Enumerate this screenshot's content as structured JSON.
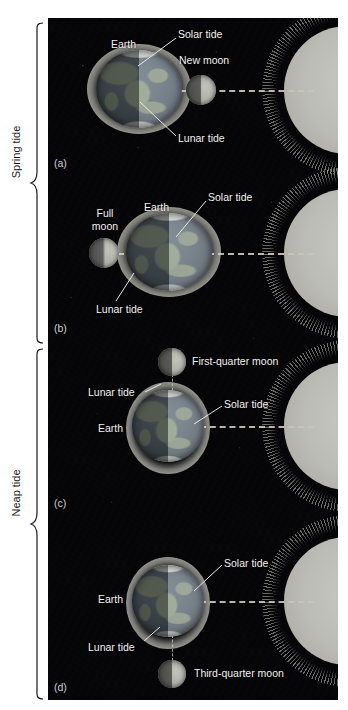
{
  "figure": {
    "type": "diagram",
    "background_color": "#050507",
    "label_color": "#f2f2ee"
  },
  "brackets": [
    {
      "id": "spring",
      "label": "Spring tide",
      "covers": [
        "a",
        "b"
      ]
    },
    {
      "id": "neap",
      "label": "Neap tide",
      "covers": [
        "c",
        "d"
      ]
    }
  ],
  "panels": [
    {
      "id": "a",
      "letter": "(a)",
      "earth_label": "Earth",
      "moon_label": "New moon",
      "moon_phase": "new",
      "moon_position": "right-of-earth",
      "earth_shape": "horizontally-elongated",
      "callouts": [
        "Solar tide",
        "Lunar tide"
      ],
      "alignment": "Sun, Moon and Earth in a line"
    },
    {
      "id": "b",
      "letter": "(b)",
      "earth_label": "Earth",
      "moon_label": "Full moon",
      "moon_phase": "full",
      "moon_position": "left-of-earth",
      "earth_shape": "horizontally-elongated",
      "callouts": [
        "Solar tide",
        "Lunar tide"
      ],
      "alignment": "Sun, Earth and Moon in a line"
    },
    {
      "id": "c",
      "letter": "(c)",
      "earth_label": "Earth",
      "moon_label": "First-quarter moon",
      "moon_phase": "first-quarter",
      "moon_position": "above-earth",
      "earth_shape": "round",
      "callouts": [
        "Solar tide",
        "Lunar tide"
      ],
      "alignment": "Moon at right angle to Sun-Earth line"
    },
    {
      "id": "d",
      "letter": "(d)",
      "earth_label": "Earth",
      "moon_label": "Third-quarter moon",
      "moon_phase": "third-quarter",
      "moon_position": "below-earth",
      "earth_shape": "round",
      "callouts": [
        "Solar tide",
        "Lunar tide"
      ],
      "alignment": "Moon at right angle to Sun-Earth line"
    }
  ],
  "bodies": {
    "sun": {
      "name": "Sun",
      "color": "#bcbcb6",
      "position": "right-edge",
      "drawn": "partial disc with corona"
    },
    "earth": {
      "name": "Earth",
      "color": "#5d6a74"
    },
    "moon": {
      "name": "Moon",
      "color": "#a8a8a1"
    }
  },
  "labels": {
    "solar_tide": "Solar tide",
    "lunar_tide": "Lunar tide",
    "earth": "Earth",
    "new_moon": "New moon",
    "full_moon_line1": "Full",
    "full_moon_line2": "moon",
    "first_quarter_moon": "First-quarter moon",
    "third_quarter_moon": "Third-quarter moon",
    "spring_tide": "Spring tide",
    "neap_tide": "Neap tide",
    "panel_a": "(a)",
    "panel_b": "(b)",
    "panel_c": "(c)",
    "panel_d": "(d)"
  }
}
